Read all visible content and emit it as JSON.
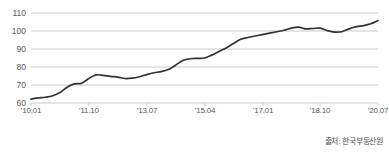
{
  "chart_data": {
    "type": "line",
    "title": "",
    "subtitle": "",
    "xlabel": "",
    "ylabel": "",
    "ylim": [
      60,
      110
    ],
    "yticks": [
      60,
      70,
      80,
      90,
      100,
      110
    ],
    "ytick_labels": [
      "60",
      "70",
      "80",
      "90",
      "100",
      "110"
    ],
    "xticks": [
      "'10.01",
      "'11.10",
      "'13.07",
      "'15.04",
      "'17.01",
      "'18.10",
      "'20.07"
    ],
    "xtick_labels": [
      "'10.01",
      "'11.10",
      "'13.07",
      "'15.04",
      "'17.01",
      "'18.10",
      "'20.07"
    ],
    "xlim_labels": [
      "'10.01",
      "'20.10"
    ],
    "grid": true,
    "grid_axis": "y",
    "legend": false,
    "legend_position": "none",
    "line_color": "#333333",
    "grid_color": "#c9c9c9",
    "axis_label_color": "#58595b",
    "background_color": "#ffffff",
    "series": [
      {
        "name": "주택매매가격지수",
        "x": [
          "'10.01",
          "'10.04",
          "'10.07",
          "'10.10",
          "'11.01",
          "'11.04",
          "'11.07",
          "'11.10",
          "'12.01",
          "'12.04",
          "'12.07",
          "'12.10",
          "'13.01",
          "'13.04",
          "'13.07",
          "'13.10",
          "'14.01",
          "'14.04",
          "'14.07",
          "'14.10",
          "'15.01",
          "'15.04",
          "'15.07",
          "'15.10",
          "'16.01",
          "'16.04",
          "'16.07",
          "'16.10",
          "'17.01",
          "'17.04",
          "'17.07",
          "'17.10",
          "'18.01",
          "'18.04",
          "'18.07",
          "'18.10",
          "'19.01",
          "'19.04",
          "'19.07",
          "'19.10",
          "'20.01",
          "'20.04",
          "'20.07",
          "'20.10"
        ],
        "values": [
          62.2,
          62.8,
          63.2,
          64.0,
          65.8,
          68.8,
          70.6,
          71.0,
          73.6,
          75.6,
          75.4,
          74.8,
          74.4,
          73.6,
          73.8,
          74.6,
          75.8,
          76.8,
          77.4,
          78.6,
          81.0,
          83.6,
          84.6,
          84.8,
          85.0,
          86.6,
          88.6,
          90.6,
          93.0,
          95.4,
          96.4,
          97.2,
          98.0,
          98.8,
          99.6,
          100.4,
          101.6,
          102.2,
          101.2,
          101.4,
          101.6,
          100.2,
          99.4,
          99.6
        ],
        "end_values": [
          101.2,
          102.4,
          103.0,
          104.0,
          105.8
        ]
      }
    ]
  },
  "source": {
    "label": "출처: 한국부동산원"
  },
  "axes": {
    "y_labels": [
      "110",
      "100",
      "90",
      "80",
      "70",
      "60"
    ],
    "x_labels": [
      "'10.01",
      "'11.10",
      "'13.07",
      "'15.04",
      "'17.01",
      "'18.10",
      "'20.07"
    ]
  }
}
